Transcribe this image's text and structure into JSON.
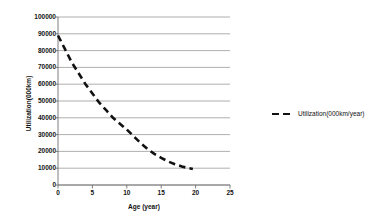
{
  "chart_data": {
    "type": "line",
    "title": "",
    "xlabel": "Age (year)",
    "ylabel": "Utilization(000km)",
    "xlim": [
      0,
      25
    ],
    "ylim": [
      0,
      100000
    ],
    "xticks": [
      0,
      5,
      10,
      15,
      20,
      25
    ],
    "yticks": [
      0,
      10000,
      20000,
      30000,
      40000,
      50000,
      60000,
      70000,
      80000,
      90000,
      100000
    ],
    "grid": "horizontal",
    "legend_position": "right",
    "series": [
      {
        "name": "Utilization(000km/year)",
        "style": "dashed",
        "color": "#111111",
        "x": [
          0,
          1,
          2,
          3,
          4,
          5,
          6,
          7,
          8,
          9,
          10,
          11,
          12,
          13,
          14,
          15,
          16,
          17,
          18,
          19,
          19.6
        ],
        "values": [
          89000,
          81000,
          73000,
          66500,
          60000,
          54500,
          49000,
          44500,
          40000,
          36500,
          33000,
          29000,
          25000,
          21500,
          18500,
          16200,
          14000,
          12400,
          11000,
          10000,
          9500
        ]
      }
    ]
  },
  "axes": {
    "y_tick_labels": [
      "100000",
      "90000",
      "80000",
      "70000",
      "60000",
      "50000",
      "40000",
      "30000",
      "20000",
      "10000",
      "0"
    ],
    "x_tick_labels": [
      "0",
      "5",
      "10",
      "15",
      "20",
      "25"
    ],
    "y_title": "Utilization(000km)",
    "x_title": "Age (year)"
  },
  "legend": {
    "entries": [
      {
        "label": "Utilization(000km/year)"
      }
    ]
  }
}
